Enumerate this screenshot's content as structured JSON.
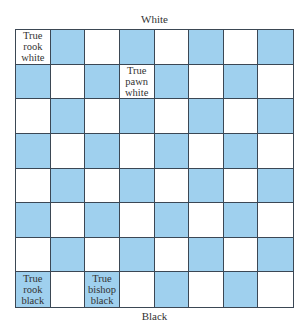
{
  "labels": {
    "top": "White",
    "bottom": "Black"
  },
  "colors": {
    "light_square": "#ffffff",
    "dark_square": "#9fd0ee",
    "grid_line": "#3b4754"
  },
  "board": {
    "rows": 8,
    "cols": 8,
    "top_left_color": "light",
    "pieces": [
      {
        "row": 0,
        "col": 0,
        "text": "True\nrook\nwhite"
      },
      {
        "row": 1,
        "col": 3,
        "text": "True\npawn\nwhite"
      },
      {
        "row": 7,
        "col": 0,
        "text": "True\nrook\nblack"
      },
      {
        "row": 7,
        "col": 2,
        "text": "True\nbishop\nblack"
      }
    ]
  }
}
